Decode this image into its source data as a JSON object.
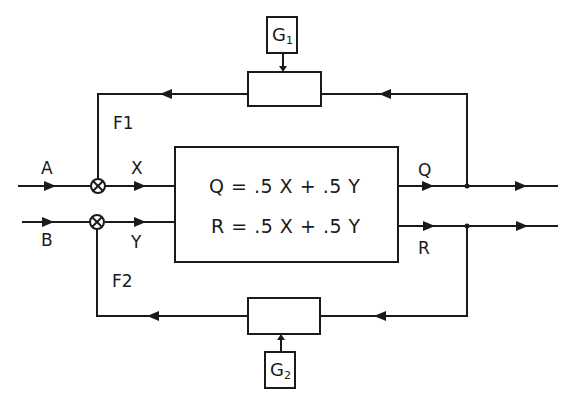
{
  "diagram": {
    "type": "block-diagram",
    "inputs": [
      {
        "id": "A",
        "label": "A"
      },
      {
        "id": "B",
        "label": "B"
      }
    ],
    "mixed_streams": [
      {
        "id": "X",
        "label": "X"
      },
      {
        "id": "Y",
        "label": "Y"
      }
    ],
    "feedback_streams": [
      {
        "id": "F1",
        "label": "F1"
      },
      {
        "id": "F2",
        "label": "F2"
      }
    ],
    "outputs": [
      {
        "id": "Q",
        "label": "Q"
      },
      {
        "id": "R",
        "label": "R"
      }
    ],
    "process_block": {
      "equations": [
        "Q = .5 X + .5 Y",
        "R = .5 X + .5 Y"
      ]
    },
    "controllers": [
      {
        "id": "G1",
        "label": "G",
        "subscript": "1"
      },
      {
        "id": "G2",
        "label": "G",
        "subscript": "2"
      }
    ],
    "colors": {
      "line": "#1a1a1a",
      "background": "#ffffff"
    }
  }
}
